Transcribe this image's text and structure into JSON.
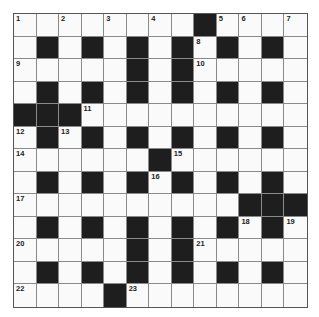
{
  "puzzle": {
    "rows": 13,
    "cols": 13,
    "colors": {
      "black_cell": "#1e1e1e",
      "white_cell": "#fafafa",
      "grid_line": "#8a8a8a"
    },
    "layout": [
      "WWWWWWWWBWWWW",
      "WBWBWBWBWBWBW",
      "WWWWWBWBWWWWW",
      "WBWBWBWBWBWBW",
      "BBBWWWWWWWWWW",
      "WBWBWBWBWBWBW",
      "WWWWWWBWWWWWW",
      "WBWBWBWBWBWBW",
      "WWWWWWWWWWBBB",
      "WBWBWBWBWBWBW",
      "WWWWWBWBWWWWW",
      "WBWBWBWBWBWBW",
      "WWWWBWWWWWWWW"
    ],
    "numbers": [
      {
        "r": 0,
        "c": 0,
        "n": "1"
      },
      {
        "r": 0,
        "c": 2,
        "n": "2"
      },
      {
        "r": 0,
        "c": 4,
        "n": "3"
      },
      {
        "r": 0,
        "c": 6,
        "n": "4"
      },
      {
        "r": 0,
        "c": 9,
        "n": "5"
      },
      {
        "r": 0,
        "c": 10,
        "n": "6"
      },
      {
        "r": 0,
        "c": 12,
        "n": "7"
      },
      {
        "r": 1,
        "c": 8,
        "n": "8"
      },
      {
        "r": 2,
        "c": 0,
        "n": "9"
      },
      {
        "r": 2,
        "c": 8,
        "n": "10"
      },
      {
        "r": 4,
        "c": 3,
        "n": "11"
      },
      {
        "r": 5,
        "c": 0,
        "n": "12"
      },
      {
        "r": 5,
        "c": 2,
        "n": "13"
      },
      {
        "r": 6,
        "c": 0,
        "n": "14"
      },
      {
        "r": 6,
        "c": 7,
        "n": "15"
      },
      {
        "r": 7,
        "c": 6,
        "n": "16"
      },
      {
        "r": 8,
        "c": 0,
        "n": "17"
      },
      {
        "r": 9,
        "c": 10,
        "n": "18"
      },
      {
        "r": 9,
        "c": 12,
        "n": "19"
      },
      {
        "r": 10,
        "c": 0,
        "n": "20"
      },
      {
        "r": 10,
        "c": 8,
        "n": "21"
      },
      {
        "r": 12,
        "c": 0,
        "n": "22"
      },
      {
        "r": 12,
        "c": 5,
        "n": "23"
      }
    ]
  }
}
